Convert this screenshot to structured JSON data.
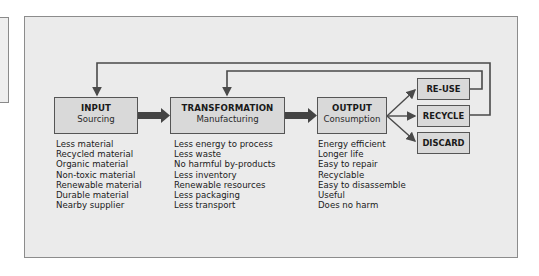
{
  "diagram": {
    "stages": [
      {
        "title": "INPUT",
        "subtitle": "Sourcing",
        "items": [
          "Less material",
          "Recycled material",
          "Organic material",
          "Non-toxic material",
          "Renewable material",
          "Durable material",
          "Nearby supplier"
        ]
      },
      {
        "title": "TRANSFORMATION",
        "subtitle": "Manufacturing",
        "items": [
          "Less energy to process",
          "Less waste",
          "No harmful by-products",
          "Less inventory",
          "Renewable resources",
          "Less packaging",
          "Less transport"
        ]
      },
      {
        "title": "OUTPUT",
        "subtitle": "Consumption",
        "items": [
          "Energy efficient",
          "Longer life",
          "Easy to repair",
          "Recyclable",
          "Easy to disassemble",
          "Useful",
          "Does no harm"
        ]
      }
    ],
    "end_of_life": [
      {
        "label": "RE-USE",
        "loops_to": "TRANSFORMATION"
      },
      {
        "label": "RECYCLE",
        "loops_to": "INPUT"
      },
      {
        "label": "DISCARD"
      }
    ],
    "colors": {
      "panel_bg": "#ebebeb",
      "box_fill": "#d9d9d9",
      "line": "#4a4a4a",
      "border": "#8c8c8c"
    }
  }
}
